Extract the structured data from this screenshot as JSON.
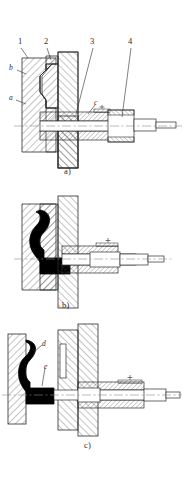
{
  "figure": {
    "background_color": "#ffffff",
    "line_color": "#2b2b2b",
    "fill_color": "#000000",
    "hatch_color": "#3a3a3a"
  },
  "panels": [
    {
      "id": "panel-a",
      "caption": "a)",
      "callouts": [
        {
          "name": "leader-1",
          "label": "1"
        },
        {
          "name": "leader-2",
          "label": "2"
        },
        {
          "name": "leader-3",
          "label": "3"
        },
        {
          "name": "leader-4",
          "label": "4"
        }
      ],
      "annotations": [
        {
          "name": "annotation-b",
          "label": "b"
        },
        {
          "name": "annotation-a",
          "label": "a"
        },
        {
          "name": "annotation-c",
          "label": "c"
        }
      ]
    },
    {
      "id": "panel-b",
      "caption": "b)",
      "callouts": [],
      "annotations": []
    },
    {
      "id": "panel-c",
      "caption": "c)",
      "callouts": [],
      "annotations": [
        {
          "name": "annotation-d",
          "label": "d"
        },
        {
          "name": "annotation-e",
          "label": "e"
        }
      ]
    }
  ]
}
